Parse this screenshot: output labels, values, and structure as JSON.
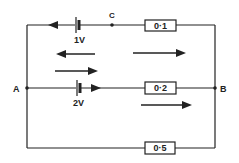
{
  "diagram": {
    "type": "electric-circuit",
    "nodes": {
      "a": {
        "label": "A"
      },
      "b": {
        "label": "B"
      },
      "c": {
        "label": "C"
      }
    },
    "branches": [
      {
        "name": "top",
        "battery_label": "1V",
        "resistor_label": "0·1"
      },
      {
        "name": "middle",
        "battery_label": "2V",
        "resistor_label": "0·2"
      },
      {
        "name": "bottom",
        "resistor_label": "0·5"
      }
    ],
    "colors": {
      "line": "#222222",
      "background": "#ffffff"
    }
  }
}
